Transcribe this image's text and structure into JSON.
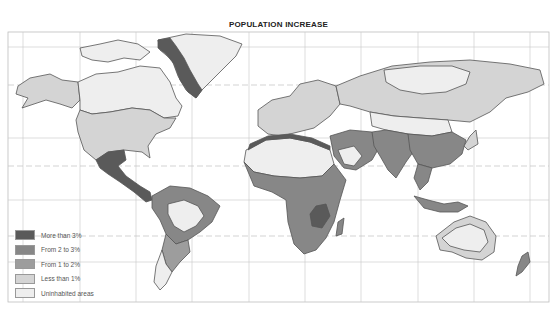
{
  "title": "POPULATION INCREASE",
  "legend": {
    "items": [
      {
        "label": "More than 3%",
        "category": "gt3",
        "color": "#5a5a5a"
      },
      {
        "label": "From 2 to 3%",
        "category": "2to3",
        "color": "#878787"
      },
      {
        "label": "From 1 to 2%",
        "category": "1to2",
        "color": "#9d9d9d"
      },
      {
        "label": "Less than 1%",
        "category": "lt1",
        "color": "#d4d4d4"
      },
      {
        "label": "Uninhabited areas",
        "category": "uninhabited",
        "color": "#eeeeee"
      }
    ]
  },
  "colors": {
    "outline": "#555555",
    "grid": "#c4c4c4",
    "water": "#ffffff"
  },
  "regions": [
    {
      "name": "canada-north",
      "category": "uninhabited"
    },
    {
      "name": "alaska",
      "category": "lt1"
    },
    {
      "name": "usa",
      "category": "lt1"
    },
    {
      "name": "greenland",
      "category": "uninhabited"
    },
    {
      "name": "greenland-west-coast",
      "category": "gt3"
    },
    {
      "name": "mexico-central-america",
      "category": "gt3"
    },
    {
      "name": "south-america-north",
      "category": "2to3"
    },
    {
      "name": "amazon-interior",
      "category": "uninhabited"
    },
    {
      "name": "south-america-south",
      "category": "1to2"
    },
    {
      "name": "patagonia",
      "category": "uninhabited"
    },
    {
      "name": "europe",
      "category": "lt1"
    },
    {
      "name": "russia-siberia",
      "category": "lt1"
    },
    {
      "name": "siberia-north",
      "category": "uninhabited"
    },
    {
      "name": "sahara",
      "category": "uninhabited"
    },
    {
      "name": "north-africa-coast",
      "category": "gt3"
    },
    {
      "name": "sub-saharan-africa",
      "category": "2to3"
    },
    {
      "name": "east-africa",
      "category": "gt3"
    },
    {
      "name": "middle-east",
      "category": "2to3"
    },
    {
      "name": "arabian-desert",
      "category": "uninhabited"
    },
    {
      "name": "south-asia",
      "category": "2to3"
    },
    {
      "name": "china",
      "category": "2to3"
    },
    {
      "name": "central-asia-desert",
      "category": "uninhabited"
    },
    {
      "name": "southeast-asia",
      "category": "2to3"
    },
    {
      "name": "japan",
      "category": "lt1"
    },
    {
      "name": "indonesia",
      "category": "2to3"
    },
    {
      "name": "australia-interior",
      "category": "uninhabited"
    },
    {
      "name": "australia-coast",
      "category": "lt1"
    },
    {
      "name": "new-zealand",
      "category": "2to3"
    },
    {
      "name": "madagascar",
      "category": "2to3"
    }
  ]
}
